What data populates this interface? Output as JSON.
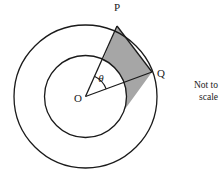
{
  "figure": {
    "kind": "concentric-circles-annulus-sector",
    "background_color": "#ffffff",
    "stroke_color": "#1a1a1a",
    "shade_color": "#a6a6a6",
    "center": {
      "label": "O",
      "x": 85.5,
      "y": 96.5
    },
    "outer_circle": {
      "radius": 71.5
    },
    "inner_circle": {
      "radius": 41
    },
    "points": [
      {
        "label": "P",
        "x": 117,
        "y": 26,
        "angle_deg": 65,
        "on": "outer_circle"
      },
      {
        "label": "Q",
        "x": 152,
        "y": 72,
        "angle_deg": 20,
        "on": "outer_circle"
      }
    ],
    "angle": {
      "label": "θ",
      "vertex": "O",
      "between": "OP and OQ",
      "arc_radius": 22
    },
    "labels": {
      "center": "O",
      "point_p": "P",
      "point_q": "Q",
      "theta": "θ"
    },
    "shaded_region": {
      "description": "region bounded by chord PQ, radius OP, and inner circle arc",
      "fill": "#a6a6a6"
    },
    "note": "Not to\nscale"
  }
}
